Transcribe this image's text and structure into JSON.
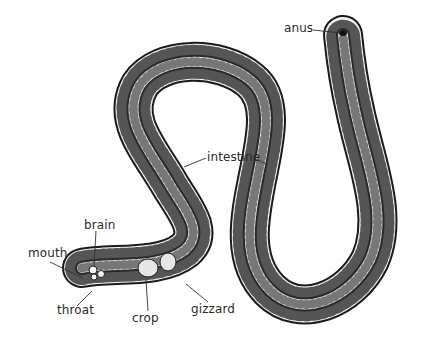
{
  "diagram": {
    "labels": {
      "anus": "anus",
      "intestine": "intestine",
      "brain": "brain",
      "mouth": "mouth",
      "throat": "throat",
      "crop": "crop",
      "gizzard": "gizzard"
    }
  }
}
